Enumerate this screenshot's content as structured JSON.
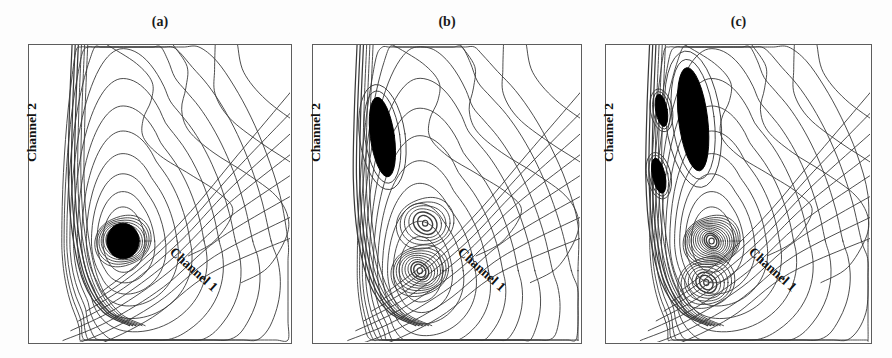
{
  "figure": {
    "background_color": "#fdfdfd",
    "frame_color": "#5d5d5d",
    "contour_color": "#3a3a3a",
    "fill_color": "#000000",
    "width": 892,
    "height": 358
  },
  "panels": [
    {
      "id": "a",
      "label": "(a)",
      "x": 28,
      "y": 44,
      "width": 264,
      "height": 300,
      "axis_labels": {
        "vertical": "Channel 2",
        "horizontal": "Channel 1"
      },
      "description": "single compact vortex core with filled black center",
      "vortex_cores": [
        {
          "cx": 0.36,
          "cy": 0.66,
          "filled": true,
          "rings": 11
        }
      ],
      "dark_blobs": []
    },
    {
      "id": "b",
      "label": "(b)",
      "x": 312,
      "y": 44,
      "width": 270,
      "height": 300,
      "axis_labels": {
        "vertical": "Channel 2",
        "horizontal": "Channel 1"
      },
      "description": "two vortex cores plus elongated dark blob near upper left wall",
      "vortex_cores": [
        {
          "cx": 0.4,
          "cy": 0.76,
          "filled": false,
          "rings": 9
        },
        {
          "cx": 0.42,
          "cy": 0.6,
          "filled": false,
          "rings": 6
        }
      ],
      "dark_blobs": [
        {
          "cx": 0.26,
          "cy": 0.31,
          "rx": 0.045,
          "ry": 0.135,
          "rot": -8
        }
      ]
    },
    {
      "id": "c",
      "label": "(c)",
      "x": 605,
      "y": 44,
      "width": 267,
      "height": 300,
      "axis_labels": {
        "vertical": "Channel 2",
        "horizontal": "Channel 1"
      },
      "description": "two tight vortex cores with white centers plus large elongated dark band and satellite blobs near upper left wall",
      "vortex_cores": [
        {
          "cx": 0.4,
          "cy": 0.66,
          "filled": false,
          "rings": 12
        },
        {
          "cx": 0.38,
          "cy": 0.8,
          "filled": false,
          "rings": 7
        }
      ],
      "dark_blobs": [
        {
          "cx": 0.33,
          "cy": 0.25,
          "rx": 0.055,
          "ry": 0.175,
          "rot": -7
        },
        {
          "cx": 0.21,
          "cy": 0.22,
          "rx": 0.022,
          "ry": 0.055,
          "rot": -10
        },
        {
          "cx": 0.2,
          "cy": 0.44,
          "rx": 0.024,
          "ry": 0.06,
          "rot": -12
        }
      ]
    }
  ]
}
